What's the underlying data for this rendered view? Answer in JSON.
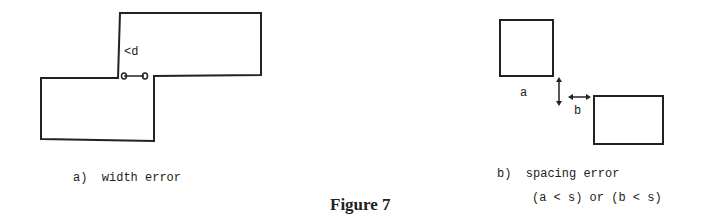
{
  "figure": {
    "title": "Figure 7",
    "panel_a": {
      "caption": "a)  width error",
      "dimension_label": "<d"
    },
    "panel_b": {
      "caption": "b)  spacing error",
      "condition": "(a < s) or (b < s)",
      "label_a": "a",
      "label_b": "b"
    }
  }
}
